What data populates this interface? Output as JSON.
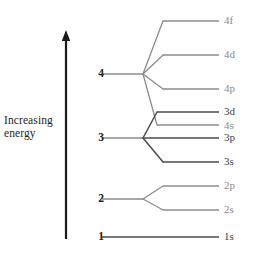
{
  "diagram": {
    "axis": {
      "caption_line1": "Increasing",
      "caption_line2": "energy",
      "arrow_direction": "up",
      "arrow_x": 66,
      "arrow_top_y": 30,
      "arrow_bottom_y": 239,
      "color": "#1a1a1a"
    },
    "colors": {
      "line_gray": "#8c8c8c",
      "line_dark": "#4a4a4a",
      "text_dark": "#231f20",
      "text_gray": "#8a8a8a",
      "background": "#ffffff"
    },
    "geometry": {
      "shell_stub_x_start": 102,
      "shell_node_x": 143,
      "orbital_line_x_start": 163,
      "orbital_line_x_end": 219,
      "label_x": 224
    },
    "shells": [
      {
        "n": "4",
        "label": "4",
        "y": 74,
        "label_x": 88,
        "node_x": 143
      },
      {
        "n": "3",
        "label": "3",
        "y": 138,
        "label_x": 88,
        "node_x": 143
      },
      {
        "n": "2",
        "label": "2",
        "y": 199,
        "label_x": 88,
        "node_x": 143
      },
      {
        "n": "1",
        "label": "1",
        "y": 237,
        "label_x": 88,
        "node_x": 143
      }
    ],
    "orbitals": [
      {
        "label": "4f",
        "y": 21,
        "x_start": 163,
        "x_end": 219,
        "shade": "gray",
        "label_y": 14,
        "from_shell": "4"
      },
      {
        "label": "4d",
        "y": 55,
        "x_start": 163,
        "x_end": 219,
        "shade": "gray",
        "label_y": 48,
        "from_shell": "4"
      },
      {
        "label": "4p",
        "y": 89,
        "x_start": 163,
        "x_end": 219,
        "shade": "gray",
        "label_y": 82,
        "from_shell": "4"
      },
      {
        "label": "3d",
        "y": 112,
        "x_start": 157,
        "x_end": 219,
        "shade": "dark",
        "label_y": 105,
        "from_shell": "3"
      },
      {
        "label": "4s",
        "y": 125,
        "x_start": 157,
        "x_end": 219,
        "shade": "gray",
        "label_y": 119,
        "from_shell": "4"
      },
      {
        "label": "3p",
        "y": 138,
        "x_start": 143,
        "x_end": 219,
        "shade": "dark",
        "label_y": 131,
        "from_shell": "3"
      },
      {
        "label": "3s",
        "y": 162,
        "x_start": 163,
        "x_end": 219,
        "shade": "dark",
        "label_y": 155,
        "from_shell": "3"
      },
      {
        "label": "2p",
        "y": 186,
        "x_start": 163,
        "x_end": 219,
        "shade": "gray",
        "label_y": 179,
        "from_shell": "2"
      },
      {
        "label": "2s",
        "y": 210,
        "x_start": 163,
        "x_end": 219,
        "shade": "gray",
        "label_y": 203,
        "from_shell": "2"
      },
      {
        "label": "1s",
        "y": 237,
        "x_start": 102,
        "x_end": 219,
        "shade": "dark",
        "label_y": 230,
        "from_shell": "1"
      }
    ],
    "connectors": [
      {
        "name": "shell-4-stub",
        "x1": 102,
        "y1": 74,
        "x2": 143,
        "y2": 74,
        "shade": "gray"
      },
      {
        "name": "shell-3-stub",
        "x1": 102,
        "y1": 138,
        "x2": 143,
        "y2": 138,
        "shade": "gray"
      },
      {
        "name": "shell-2-stub",
        "x1": 102,
        "y1": 199,
        "x2": 143,
        "y2": 199,
        "shade": "gray"
      },
      {
        "name": "branch-4-to-4f",
        "x1": 143,
        "y1": 74,
        "x2": 163,
        "y2": 21,
        "shade": "gray"
      },
      {
        "name": "branch-4-to-4d",
        "x1": 143,
        "y1": 74,
        "x2": 163,
        "y2": 55,
        "shade": "gray"
      },
      {
        "name": "branch-4-to-4p",
        "x1": 143,
        "y1": 74,
        "x2": 163,
        "y2": 89,
        "shade": "gray"
      },
      {
        "name": "branch-4-to-4s",
        "x1": 143,
        "y1": 74,
        "x2": 157,
        "y2": 125,
        "shade": "gray"
      },
      {
        "name": "branch-3-to-3d",
        "x1": 143,
        "y1": 138,
        "x2": 157,
        "y2": 112,
        "shade": "dark"
      },
      {
        "name": "branch-3-to-3s",
        "x1": 143,
        "y1": 138,
        "x2": 163,
        "y2": 162,
        "shade": "dark"
      },
      {
        "name": "branch-2-to-2p",
        "x1": 143,
        "y1": 199,
        "x2": 163,
        "y2": 186,
        "shade": "gray"
      },
      {
        "name": "branch-2-to-2s",
        "x1": 143,
        "y1": 199,
        "x2": 163,
        "y2": 210,
        "shade": "gray"
      }
    ]
  }
}
